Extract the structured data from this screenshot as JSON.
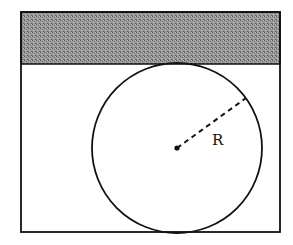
{
  "diagram": {
    "type": "geometry",
    "outer_rect": {
      "x": 21,
      "y": 12,
      "width": 259,
      "height": 220
    },
    "shaded_band": {
      "x": 21,
      "y": 12,
      "width": 259,
      "height": 52
    },
    "circle": {
      "cx": 177,
      "cy": 148,
      "r": 85
    },
    "center_point": {
      "cx": 177,
      "cy": 148
    },
    "radius_line": {
      "x1": 177,
      "y1": 148,
      "x2": 246,
      "y2": 98,
      "style": "dashed"
    },
    "radius_label": {
      "text": "R",
      "x": 212,
      "y": 145
    },
    "colors": {
      "stroke": "#111111",
      "shading": "#8a8a8a",
      "background": "#ffffff"
    }
  }
}
